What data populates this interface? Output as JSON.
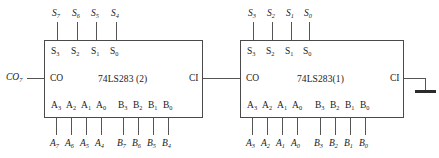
{
  "diagram": {
    "wire_color": "#555555",
    "chip_border_color": "#4a4a4a",
    "ground_color": "#2b2b2b"
  },
  "chips": [
    {
      "id": "u2",
      "name": "74LS283 (2)",
      "sum_pins": [
        "S3",
        "S2",
        "S1",
        "S0"
      ],
      "a_pins": [
        "A3",
        "A2",
        "A1",
        "A0"
      ],
      "b_pins": [
        "B3",
        "B2",
        "B1",
        "B0"
      ],
      "carry_out_pin": "CO",
      "carry_in_pin": "CI",
      "sum_signals": [
        "S7",
        "S6",
        "S5",
        "S4"
      ],
      "a_signals": [
        "A7",
        "A6",
        "A5",
        "A4"
      ],
      "b_signals": [
        "B7",
        "B6",
        "B5",
        "B4"
      ],
      "carry_out_signal": "CO7"
    },
    {
      "id": "u1",
      "name": "74LS283(1)",
      "sum_pins": [
        "S3",
        "S2",
        "S1",
        "S0"
      ],
      "a_pins": [
        "A3",
        "A2",
        "A1",
        "A0"
      ],
      "b_pins": [
        "B3",
        "B2",
        "B1",
        "B0"
      ],
      "carry_out_pin": "CO",
      "carry_in_pin": "CI",
      "sum_signals": [
        "S3",
        "S2",
        "S1",
        "S0"
      ],
      "a_signals": [
        "A3",
        "A2",
        "A1",
        "A0"
      ],
      "b_signals": [
        "B3",
        "B2",
        "B1",
        "B0"
      ],
      "carry_in_signal": "GND"
    }
  ],
  "subscripts": {
    "S7": [
      "S",
      "7"
    ],
    "S6": [
      "S",
      "6"
    ],
    "S5": [
      "S",
      "5"
    ],
    "S4": [
      "S",
      "4"
    ],
    "S3": [
      "S",
      "3"
    ],
    "S2": [
      "S",
      "2"
    ],
    "S1": [
      "S",
      "1"
    ],
    "S0": [
      "S",
      "0"
    ],
    "A7": [
      "A",
      "7"
    ],
    "A6": [
      "A",
      "6"
    ],
    "A5": [
      "A",
      "5"
    ],
    "A4": [
      "A",
      "4"
    ],
    "A3": [
      "A",
      "3"
    ],
    "A2": [
      "A",
      "2"
    ],
    "A1": [
      "A",
      "1"
    ],
    "A0": [
      "A",
      "0"
    ],
    "B7": [
      "B",
      "7"
    ],
    "B6": [
      "B",
      "6"
    ],
    "B5": [
      "B",
      "5"
    ],
    "B4": [
      "B",
      "4"
    ],
    "B3": [
      "B",
      "3"
    ],
    "B2": [
      "B",
      "2"
    ],
    "B1": [
      "B",
      "1"
    ],
    "B0": [
      "B",
      "0"
    ],
    "CO7": [
      "CO",
      "7"
    ]
  }
}
